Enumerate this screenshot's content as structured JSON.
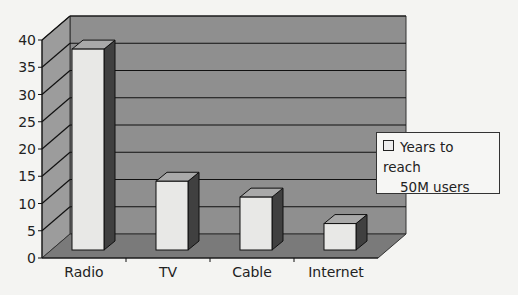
{
  "chart_data": {
    "type": "bar",
    "style": "3d-column",
    "title": "",
    "xlabel": "",
    "ylabel": "",
    "categories": [
      "Radio",
      "TV",
      "Cable",
      "Internet"
    ],
    "series": [
      {
        "name": "Years to reach 50M users",
        "values": [
          38,
          13,
          10,
          5
        ]
      }
    ],
    "ylim": [
      0,
      40
    ],
    "yticks": [
      0,
      5,
      10,
      15,
      20,
      25,
      30,
      35,
      40
    ],
    "grid": true,
    "legend_position": "right"
  },
  "legend": {
    "line1": "Years to reach",
    "line2": "50M users"
  },
  "colors": {
    "wall": "#8f8f8f",
    "floor": "#7a7a7a",
    "bar_front": "#e8e8e6",
    "bar_side": "#404040",
    "bar_top": "#a9a9a9"
  }
}
